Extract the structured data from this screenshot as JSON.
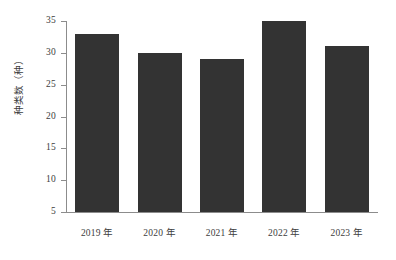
{
  "chart_data": {
    "type": "bar",
    "title": "",
    "subtitle": "",
    "xlabel": "",
    "ylabel": "种类数（种）",
    "categories": [
      "2019 年",
      "2020 年",
      "2021 年",
      "2022 年",
      "2023 年"
    ],
    "values": [
      33,
      30,
      29,
      35,
      31
    ],
    "series": [
      {
        "name": "种类数",
        "values": [
          33,
          30,
          29,
          35,
          31
        ]
      }
    ],
    "ylim": [
      5,
      35
    ],
    "ytick_values": [
      35,
      30,
      25,
      20,
      15,
      10,
      5
    ],
    "ytick_labels": [
      "35",
      "30",
      "25",
      "20",
      "15",
      "10",
      "5"
    ],
    "grid": false,
    "legend": false,
    "legend_position": "none",
    "bar_color": "#333333",
    "axis_color": "#8c8c8c",
    "text_color": "#3d3d3d",
    "background_color": "#ffffff",
    "annotations": []
  }
}
